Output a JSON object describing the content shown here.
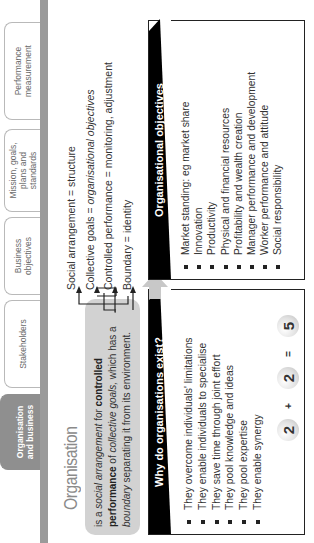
{
  "tabs": [
    {
      "label": "Organisation and business",
      "active": true
    },
    {
      "label": "Stakeholders",
      "active": false
    },
    {
      "label": "Business objectives",
      "active": false
    },
    {
      "label": "Mission, goals, plans and standards",
      "active": false
    },
    {
      "label": "Performance measurement",
      "active": false
    }
  ],
  "heading": "Organisation",
  "definition": {
    "p1": "is a ",
    "p2_italic": "social arrangement",
    "p3": " for ",
    "p4_bold": "controlled performance",
    "p5": " of ",
    "p6_italic": "collective goals,",
    "p7": " which has a ",
    "p8_italic": "boundary",
    "p9": " separating it from its environment."
  },
  "statements": [
    {
      "text": "Social arrangement = structure"
    },
    {
      "text_prefix": "Collective goals = ",
      "text_italic": "organisational objectives"
    },
    {
      "text": "Controlled performance = monitoring, adjustment"
    },
    {
      "text": "Boundary = identity"
    }
  ],
  "why_box": {
    "title": "Why do organisations exist?",
    "items": [
      "They overcome individuals' limitations",
      "They enable individuals to specialise",
      "They save time through joint effort",
      "They pool knowledge and ideas",
      "They pool expertise",
      "They enable synergy"
    ],
    "equation": {
      "a": "2",
      "plus": "+",
      "b": "2",
      "equals": "=",
      "result": "5"
    }
  },
  "objectives_box": {
    "title": "Organisational objectives",
    "items": [
      "Market standing: eg market share",
      "Innovation",
      "Productivity",
      "Physical and financial resources",
      "Profitability and wealth creation",
      "Manager performance and development",
      "Worker performance and attitude",
      "Social responsibility"
    ]
  },
  "colors": {
    "active_tab": "#8f8f8f",
    "gray_bar": "#9a9a9a",
    "definition_bg": "#d2d2d2",
    "header_black": "#000000"
  }
}
